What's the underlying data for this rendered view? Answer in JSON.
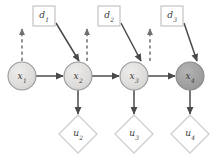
{
  "diagram": {
    "colors": {
      "state_fill_unobserved": "#dedcda",
      "state_fill_observed": "#9f9f9f",
      "state_stroke": "#9a9a9a",
      "decision_fill": "#ffffff",
      "decision_stroke": "#c8c8c8",
      "utility_fill": "#ffffff",
      "utility_stroke": "#cfcfcf",
      "edge_solid": "#4a4a4a",
      "edge_dashed": "#6f6f6f",
      "label_text": "#3a3a3a",
      "background": "#ffffff"
    },
    "decision_nodes": [
      {
        "id": "d1",
        "base": "d",
        "sub": "1",
        "cx": 44,
        "cy": 16,
        "w": 22,
        "h": 20
      },
      {
        "id": "d2",
        "base": "d",
        "sub": "2",
        "cx": 109,
        "cy": 16,
        "w": 22,
        "h": 20
      },
      {
        "id": "d3",
        "base": "d",
        "sub": "3",
        "cx": 172,
        "cy": 16,
        "w": 22,
        "h": 20
      }
    ],
    "state_nodes": [
      {
        "id": "x1",
        "base": "x",
        "sub": "1",
        "cx": 22,
        "cy": 76,
        "r": 14,
        "observed": false
      },
      {
        "id": "x2",
        "base": "x",
        "sub": "2",
        "cx": 78,
        "cy": 76,
        "r": 14,
        "observed": false
      },
      {
        "id": "x3",
        "base": "x",
        "sub": "3",
        "cx": 134,
        "cy": 76,
        "r": 14,
        "observed": false
      },
      {
        "id": "x4",
        "base": "x",
        "sub": "4",
        "cx": 190,
        "cy": 76,
        "r": 14,
        "observed": true
      }
    ],
    "utility_nodes": [
      {
        "id": "u2",
        "base": "u",
        "sub": "2",
        "cx": 78,
        "cy": 134,
        "rx": 19,
        "ry": 19
      },
      {
        "id": "u3",
        "base": "u",
        "sub": "3",
        "cx": 134,
        "cy": 134,
        "rx": 19,
        "ry": 19
      },
      {
        "id": "u4",
        "base": "u",
        "sub": "4",
        "cx": 190,
        "cy": 134,
        "rx": 19,
        "ry": 19
      }
    ],
    "edges": [
      {
        "id": "x1-to-d1",
        "from": "x1",
        "to": "d1",
        "style": "dashed",
        "kind": "information-link"
      },
      {
        "id": "x2-to-d2",
        "from": "x2",
        "to": "d2",
        "style": "dashed",
        "kind": "information-link"
      },
      {
        "id": "x3-to-d3",
        "from": "x3",
        "to": "d3",
        "style": "dashed",
        "kind": "information-link"
      },
      {
        "id": "d1-to-x2",
        "from": "d1",
        "to": "x2",
        "style": "solid",
        "kind": "decision-link"
      },
      {
        "id": "d2-to-x3",
        "from": "d2",
        "to": "x3",
        "style": "solid",
        "kind": "decision-link"
      },
      {
        "id": "d3-to-x4",
        "from": "d3",
        "to": "x4",
        "style": "solid",
        "kind": "decision-link"
      },
      {
        "id": "x1-to-x2",
        "from": "x1",
        "to": "x2",
        "style": "solid",
        "kind": "transition-link"
      },
      {
        "id": "x2-to-x3",
        "from": "x2",
        "to": "x3",
        "style": "solid",
        "kind": "transition-link"
      },
      {
        "id": "x3-to-x4",
        "from": "x3",
        "to": "x4",
        "style": "solid",
        "kind": "transition-link"
      },
      {
        "id": "x2-to-u2",
        "from": "x2",
        "to": "u2",
        "style": "solid",
        "kind": "utility-link"
      },
      {
        "id": "x3-to-u3",
        "from": "x3",
        "to": "u3",
        "style": "solid",
        "kind": "utility-link"
      },
      {
        "id": "x4-to-u4",
        "from": "x4",
        "to": "u4",
        "style": "solid",
        "kind": "utility-link"
      }
    ]
  }
}
